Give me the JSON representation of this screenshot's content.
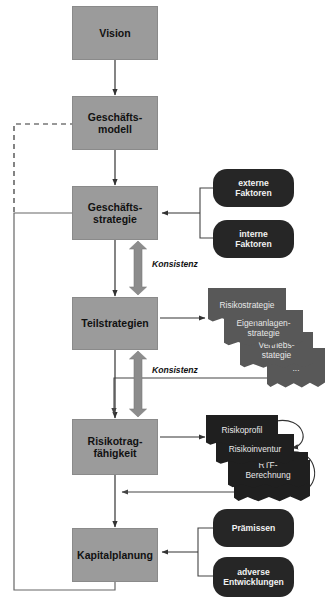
{
  "diagram": {
    "colors": {
      "process_box": "#9b9b9b",
      "factor_pill": "#262626",
      "strategy_doc": "#585858",
      "risk_doc": "#1f1f1f",
      "arrow": "#333333",
      "wide_arrow": "#8c8c8c",
      "background": "#ffffff"
    },
    "process_boxes": [
      {
        "id": "vision",
        "label": "Vision"
      },
      {
        "id": "geschaeftsmodell",
        "label": "Geschäfts-\nmodell",
        "line1": "Geschäfts-",
        "line2": "modell"
      },
      {
        "id": "geschaeftsstrategie",
        "label": "Geschäfts-\nstrategie",
        "line1": "Geschäfts-",
        "line2": "strategie"
      },
      {
        "id": "teilstrategien",
        "label": "Teilstrategien"
      },
      {
        "id": "risikotragfaehigkeit",
        "label": "Risikotrag-\nfähigkeit",
        "line1": "Risikotrag-",
        "line2": "fähigkeit"
      },
      {
        "id": "kapitalplanung",
        "label": "Kapitalplanung"
      }
    ],
    "factor_pills": [
      {
        "id": "externe-faktoren",
        "line1": "externe",
        "line2": "Faktoren"
      },
      {
        "id": "interne-faktoren",
        "line1": "interne",
        "line2": "Faktoren"
      }
    ],
    "strategy_docs": [
      {
        "id": "risikostrategie",
        "line1": "Risikostrategie",
        "line2": ""
      },
      {
        "id": "eigenanlagenstrategie",
        "line1": "Eigenanlagen-",
        "line2": "strategie"
      },
      {
        "id": "vertriebsstrategie",
        "line1": "Vertriebs-",
        "line2": "stategie"
      },
      {
        "id": "weitere-strategien",
        "line1": "...",
        "line2": ""
      }
    ],
    "risk_docs": [
      {
        "id": "risikoprofil",
        "line1": "Risikoprofil",
        "line2": ""
      },
      {
        "id": "risikoinventur",
        "line1": "Risikoinventur",
        "line2": ""
      },
      {
        "id": "rtf-berechnung",
        "line1": "RTF-",
        "line2": "Berechnung"
      },
      {
        "id": "weitere-risiken",
        "line1": "",
        "line2": ""
      }
    ],
    "planning_pills": [
      {
        "id": "praemissen",
        "line1": "Prämissen",
        "line2": ""
      },
      {
        "id": "adverse-entwicklungen",
        "line1": "adverse",
        "line2": "Entwicklungen"
      }
    ],
    "consistency_labels": [
      {
        "id": "konsistenz-oben",
        "text": "Konsistenz"
      },
      {
        "id": "konsistenz-unten",
        "text": "Konsistenz"
      }
    ]
  }
}
